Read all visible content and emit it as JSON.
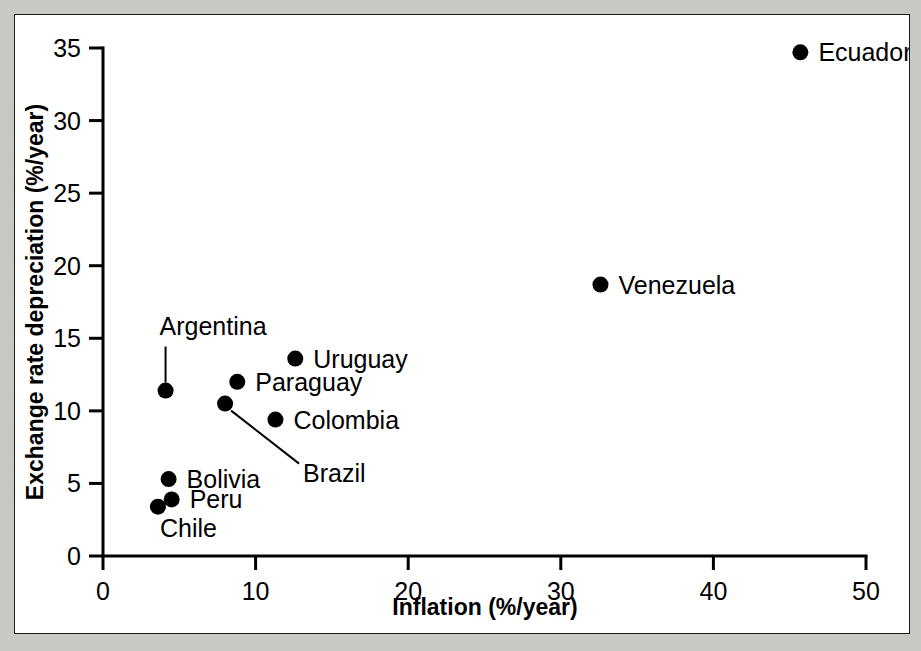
{
  "chart_data": {
    "type": "scatter",
    "title": "",
    "xlabel": "Inflation (%/year)",
    "ylabel": "Exchange rate depreciation (%/year)",
    "xlim": [
      0,
      50
    ],
    "ylim": [
      0,
      35
    ],
    "xticks": [
      "0",
      "10",
      "20",
      "30",
      "40",
      "50"
    ],
    "xtick_values": [
      0,
      10,
      20,
      30,
      40,
      50
    ],
    "yticks": [
      "0",
      "5",
      "10",
      "15",
      "20",
      "25",
      "30",
      "35"
    ],
    "ytick_values": [
      0,
      5,
      10,
      15,
      20,
      25,
      30,
      35
    ],
    "grid": false,
    "legend": false,
    "points": [
      {
        "name": "Ecuador",
        "x": 45.7,
        "y": 34.7,
        "label_pos": "right"
      },
      {
        "name": "Venezuela",
        "x": 32.6,
        "y": 18.7,
        "label_pos": "right"
      },
      {
        "name": "Uruguay",
        "x": 12.6,
        "y": 13.6,
        "label_pos": "right"
      },
      {
        "name": "Paraguay",
        "x": 8.8,
        "y": 12.0,
        "label_pos": "right"
      },
      {
        "name": "Colombia",
        "x": 11.3,
        "y": 9.4,
        "label_pos": "right"
      },
      {
        "name": "Brazil",
        "x": 8.0,
        "y": 10.5,
        "label_pos": "leader-down-right"
      },
      {
        "name": "Argentina",
        "x": 4.1,
        "y": 11.4,
        "label_pos": "leader-up"
      },
      {
        "name": "Bolivia",
        "x": 4.3,
        "y": 5.3,
        "label_pos": "right"
      },
      {
        "name": "Peru",
        "x": 4.5,
        "y": 3.9,
        "label_pos": "right"
      },
      {
        "name": "Chile",
        "x": 3.6,
        "y": 3.4,
        "label_pos": "below-right"
      }
    ]
  },
  "figure": {
    "background": "#ffffff",
    "border_color": "#1a1a1a",
    "marker_color": "#000000"
  }
}
